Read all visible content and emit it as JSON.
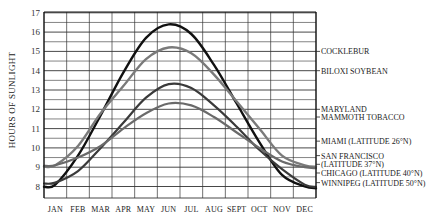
{
  "chart_data": {
    "type": "line",
    "title": "",
    "xlabel": "",
    "ylabel": "HOURS OF SUNLIGHT",
    "ylim": [
      8,
      17
    ],
    "yticks": [
      8,
      9,
      10,
      11,
      12,
      13,
      14,
      15,
      16,
      17
    ],
    "grid": true,
    "categories": [
      "JAN",
      "FEB",
      "MAR",
      "APR",
      "MAY",
      "JUN",
      "JUL",
      "AUG",
      "SEPT",
      "OCT",
      "NOV",
      "DEC"
    ],
    "series": [
      {
        "name": "WINNIPEG (LATITUDE 50°N)",
        "color": "#111111",
        "width": 2.4,
        "values": [
          8.1,
          9.6,
          11.7,
          13.9,
          15.7,
          16.4,
          15.9,
          14.3,
          12.3,
          10.3,
          8.6,
          8.0
        ]
      },
      {
        "name": "CHICAGO (LATITUDE 40°N)",
        "color": "#7a7a7a",
        "width": 2.4,
        "values": [
          9.1,
          10.1,
          11.8,
          13.2,
          14.6,
          15.2,
          14.9,
          13.8,
          12.4,
          11.0,
          9.6,
          9.1
        ]
      },
      {
        "name": "SAN FRANCISCO (LATITUDE 37°N)",
        "color": "#3a3a3a",
        "width": 2.2,
        "values": [
          8.2,
          8.8,
          10.0,
          11.3,
          12.6,
          13.3,
          13.1,
          12.2,
          11.1,
          9.9,
          8.9,
          8.1
        ]
      },
      {
        "name": "MIAMI (LATITUDE 26°N)",
        "color": "#6a6a6a",
        "width": 2.2,
        "values": [
          9.1,
          9.5,
          10.1,
          11.0,
          11.8,
          12.3,
          12.2,
          11.6,
          10.8,
          10.0,
          9.3,
          9.0
        ]
      }
    ],
    "annotations": [
      {
        "text": "COCKLEBUR",
        "y": 15
      },
      {
        "text": "BILOXI SOYBEAN",
        "y": 14
      },
      {
        "text": "MARYLAND",
        "y": 12
      },
      {
        "text": "MAMMOTH TOBACCO",
        "y": 11.6
      },
      {
        "text": "MIAMI (LATITUDE 26°N)",
        "y": 10.35
      },
      {
        "text": "SAN FRANCISCO",
        "y": 9.6
      },
      {
        "text": "(LATITUDE 37°N)",
        "y": 9.15
      },
      {
        "text": "CHICAGO (LATITUDE 40°N)",
        "y": 8.7
      },
      {
        "text": "WINNIPEG (LATITUDE 50°N)",
        "y": 8.2
      }
    ],
    "legend_position": "right (inline labels)"
  }
}
